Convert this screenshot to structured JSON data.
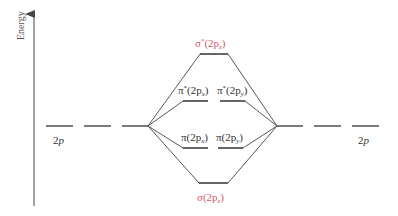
{
  "diagram": {
    "type": "molecular-orbital-energy-diagram",
    "axis": {
      "label": "Energy",
      "direction": "up"
    },
    "atomic_orbitals": {
      "left": {
        "label": "2p",
        "count": 3
      },
      "right": {
        "label": "2p",
        "count": 3
      }
    },
    "molecular_orbitals": [
      {
        "id": "sigma_star",
        "label": "σ*(2pz)",
        "display_main": "σ",
        "display_sup": "*",
        "display_rest": "(2p",
        "display_sub": "z",
        "display_close": ")",
        "count": 1,
        "highlight": true
      },
      {
        "id": "pi_star",
        "labels": [
          {
            "main": "π",
            "sup": "*",
            "rest": "(2p",
            "sub": "x",
            "close": ")"
          },
          {
            "main": "π",
            "sup": "*",
            "rest": "(2p",
            "sub": "y",
            "close": ")"
          }
        ],
        "label": "π*(2px) π*(2py)",
        "count": 2,
        "highlight": false
      },
      {
        "id": "pi",
        "labels": [
          {
            "main": "π",
            "rest": "(2p",
            "sub": "x",
            "close": ")"
          },
          {
            "main": "π",
            "rest": "(2p",
            "sub": "y",
            "close": ")"
          }
        ],
        "label": "π(2px) π(2py)",
        "count": 2,
        "highlight": false
      },
      {
        "id": "sigma",
        "label": "σ(2pz)",
        "display_main": "σ",
        "display_rest": "(2p",
        "display_sub": "z",
        "display_close": ")",
        "count": 1,
        "highlight": true
      }
    ],
    "colors": {
      "line": "#333333",
      "highlight_label": "#d9566a",
      "axis": "#555555"
    }
  }
}
